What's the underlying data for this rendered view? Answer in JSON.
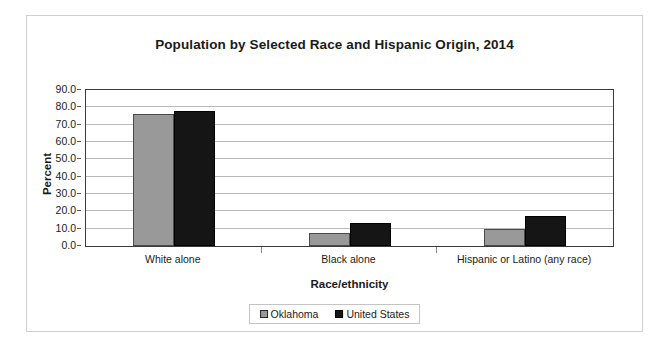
{
  "chart_data": {
    "type": "bar",
    "title": "Population by Selected Race and Hispanic Origin, 2014",
    "xlabel": "Race/ethnicity",
    "ylabel": "Percent",
    "categories": [
      "White alone",
      "Black alone",
      "Hispanic or Latino (any race)"
    ],
    "series": [
      {
        "name": "Oklahoma",
        "color": "#999999",
        "values": [
          76.0,
          7.6,
          9.8
        ]
      },
      {
        "name": "United States",
        "color": "#151515",
        "values": [
          77.7,
          13.2,
          17.3
        ]
      }
    ],
    "ylim": [
      0.0,
      90.0
    ],
    "ytick_step": 10.0,
    "ytick_labels": [
      "90.0",
      "80.0",
      "70.0",
      "60.0",
      "50.0",
      "40.0",
      "30.0",
      "20.0",
      "10.0",
      "0.0"
    ],
    "grid": true,
    "legend_position": "bottom"
  },
  "legend": {
    "items": [
      {
        "label": "Oklahoma",
        "swatch": "gray-square-swatch"
      },
      {
        "label": "United States",
        "swatch": "black-square-swatch"
      }
    ]
  }
}
